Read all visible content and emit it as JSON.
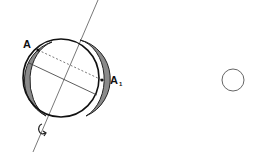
{
  "diagram": {
    "labels": {
      "point_a": "A",
      "point_a1": "A",
      "point_a1_subscript": "1"
    },
    "icons": {
      "rotation_arrow": "curved-rotation-arrow-icon"
    },
    "colors": {
      "stroke": "#222222",
      "shading": "#8a8a8a",
      "small_circle": "#666666"
    }
  }
}
